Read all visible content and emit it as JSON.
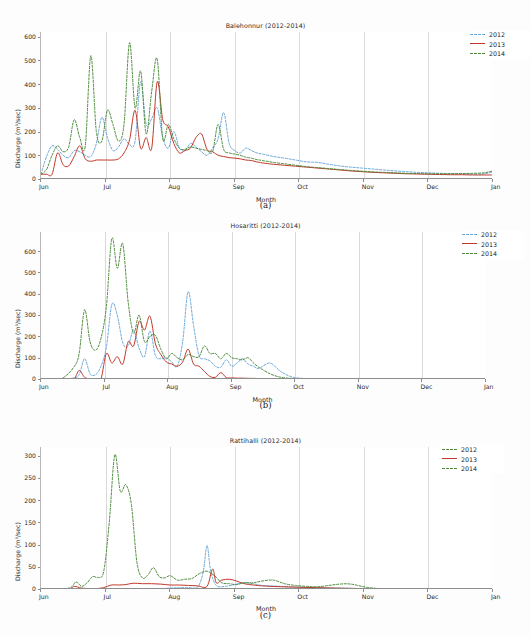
{
  "figure": {
    "page_width": 531,
    "page_height": 635,
    "top_strip_text": ""
  },
  "legend_labels": [
    "2012",
    "2013",
    "2014"
  ],
  "colors": {
    "series_2012": "#6aa8d8",
    "series_2013": "#c0392b",
    "series_2014": "#4d8b3b",
    "grid": "#d9d9d9",
    "axis": "#8d8d8d",
    "text": "#2a2a2a"
  },
  "captions": {
    "a": "(a)",
    "b": "(b)",
    "c": "(c)"
  },
  "chart_data": [
    {
      "id": "a",
      "type": "line",
      "title": "Balehonnur (2012-2014)",
      "xlabel": "Month",
      "ylabel": "Discharge (m³/sec)",
      "xticks": [
        "Jun",
        "Jul",
        "Aug",
        "Sep",
        "Oct",
        "Nov",
        "Dec",
        "Jan"
      ],
      "yticks": [
        0,
        100,
        200,
        300,
        400,
        500,
        600
      ],
      "ylim": [
        0,
        620
      ],
      "xlim": [
        0,
        245
      ],
      "grid": "vertical-at-month-starts",
      "legend_position": "upper-right-outside",
      "legend": [
        "2012",
        "2013",
        "2014"
      ],
      "series": [
        {
          "name": "2012",
          "style": "dashed",
          "color": "#6aa8d8",
          "x": [
            0,
            3,
            6,
            9,
            12,
            15,
            18,
            21,
            24,
            27,
            30,
            33,
            36,
            39,
            42,
            45,
            48,
            51,
            54,
            57,
            60,
            63,
            66,
            69,
            72,
            75,
            78,
            81,
            84,
            87,
            90,
            93,
            96,
            99,
            102,
            105,
            108,
            111,
            114,
            117,
            120,
            126,
            132,
            138,
            144,
            150,
            156,
            162,
            168,
            174,
            180,
            186,
            192,
            198,
            204,
            210,
            216,
            222,
            228,
            234,
            240,
            245
          ],
          "values": [
            20,
            95,
            140,
            125,
            100,
            90,
            120,
            115,
            100,
            95,
            150,
            260,
            175,
            120,
            135,
            170,
            145,
            160,
            410,
            230,
            255,
            300,
            175,
            130,
            200,
            130,
            120,
            150,
            135,
            115,
            100,
            130,
            170,
            280,
            150,
            120,
            110,
            130,
            120,
            110,
            105,
            95,
            88,
            80,
            72,
            70,
            62,
            55,
            50,
            46,
            42,
            38,
            34,
            31,
            28,
            26,
            24,
            23,
            22,
            21,
            22,
            30
          ]
        },
        {
          "name": "2013",
          "style": "solid",
          "color": "#c0392b",
          "x": [
            0,
            3,
            6,
            9,
            12,
            15,
            18,
            21,
            24,
            27,
            30,
            33,
            36,
            39,
            42,
            45,
            48,
            51,
            54,
            57,
            60,
            63,
            66,
            69,
            72,
            75,
            78,
            81,
            84,
            87,
            90,
            93,
            96,
            99,
            102,
            105,
            108,
            111,
            114,
            117,
            120,
            126,
            132,
            138,
            144,
            150,
            156,
            162,
            168,
            174,
            180,
            186,
            192,
            198,
            204,
            210,
            216,
            222,
            228,
            234,
            240,
            245
          ],
          "values": [
            20,
            20,
            20,
            110,
            60,
            55,
            95,
            140,
            85,
            75,
            80,
            80,
            80,
            80,
            85,
            110,
            165,
            290,
            130,
            175,
            130,
            410,
            250,
            220,
            150,
            110,
            120,
            130,
            175,
            190,
            125,
            115,
            100,
            95,
            90,
            88,
            85,
            80,
            78,
            72,
            68,
            62,
            58,
            54,
            50,
            46,
            42,
            38,
            34,
            31,
            28,
            26,
            24,
            22,
            21,
            20,
            19,
            18,
            18,
            17,
            17,
            17
          ]
        },
        {
          "name": "2014",
          "style": "dashed",
          "color": "#4d8b3b",
          "x": [
            0,
            3,
            6,
            9,
            12,
            15,
            18,
            21,
            24,
            27,
            30,
            33,
            36,
            39,
            42,
            45,
            48,
            51,
            54,
            57,
            60,
            63,
            66,
            69,
            72,
            75,
            78,
            81,
            84,
            87,
            90,
            93,
            96,
            99,
            102,
            105,
            108,
            111,
            114,
            117,
            120,
            126,
            132,
            138,
            144,
            150,
            156,
            162,
            168,
            174,
            180,
            186,
            192,
            198,
            204,
            210,
            216,
            222,
            228,
            234,
            240,
            245
          ],
          "values": [
            20,
            40,
            100,
            140,
            115,
            135,
            250,
            175,
            140,
            520,
            200,
            160,
            290,
            230,
            160,
            230,
            575,
            300,
            455,
            190,
            370,
            505,
            170,
            230,
            170,
            130,
            125,
            135,
            130,
            125,
            120,
            115,
            230,
            125,
            110,
            105,
            100,
            92,
            88,
            82,
            78,
            70,
            64,
            58,
            52,
            48,
            44,
            40,
            36,
            33,
            30,
            28,
            26,
            24,
            23,
            22,
            22,
            22,
            23,
            24,
            26,
            34
          ]
        }
      ]
    },
    {
      "id": "b",
      "type": "line",
      "title": "Hosaritti (2012-2014)",
      "xlabel": "Month",
      "ylabel": "Discharge (m³/sec)",
      "xticks": [
        "Jun",
        "Jul",
        "Aug",
        "Sep",
        "Oct",
        "Nov",
        "Dec",
        "Jan"
      ],
      "yticks": [
        0,
        100,
        200,
        300,
        400,
        500,
        600
      ],
      "ylim": [
        0,
        690
      ],
      "xlim": [
        0,
        245
      ],
      "grid": "vertical-at-month-starts",
      "legend_position": "upper-right-outside",
      "legend": [
        "2012",
        "2013",
        "2014"
      ],
      "series": [
        {
          "name": "2012",
          "style": "dashed",
          "color": "#6aa8d8",
          "x": [
            0,
            6,
            12,
            18,
            21,
            24,
            27,
            30,
            33,
            36,
            39,
            42,
            45,
            48,
            51,
            54,
            57,
            60,
            63,
            66,
            69,
            72,
            75,
            78,
            81,
            84,
            87,
            90,
            93,
            96,
            99,
            102,
            105,
            108,
            111,
            114,
            117,
            120,
            126,
            132,
            138,
            144,
            150,
            156,
            162,
            168,
            180,
            200,
            220,
            245
          ],
          "values": [
            0,
            0,
            0,
            5,
            20,
            95,
            25,
            20,
            60,
            150,
            350,
            300,
            170,
            155,
            230,
            145,
            105,
            225,
            110,
            95,
            100,
            80,
            60,
            175,
            410,
            250,
            110,
            95,
            85,
            60,
            55,
            90,
            60,
            75,
            95,
            70,
            60,
            50,
            75,
            35,
            10,
            3,
            1,
            0,
            0,
            0,
            0,
            0,
            0,
            0
          ]
        },
        {
          "name": "2013",
          "style": "solid",
          "color": "#c0392b",
          "x": [
            0,
            6,
            12,
            18,
            21,
            24,
            27,
            30,
            33,
            36,
            39,
            42,
            45,
            48,
            51,
            54,
            57,
            60,
            63,
            66,
            69,
            72,
            75,
            78,
            81,
            84,
            87,
            90,
            93,
            96,
            99,
            102,
            105,
            108,
            111,
            114,
            117,
            120,
            126,
            132,
            138,
            144,
            150,
            156,
            162,
            168,
            180,
            200,
            220,
            245
          ],
          "values": [
            0,
            0,
            0,
            0,
            40,
            8,
            0,
            0,
            0,
            120,
            75,
            105,
            70,
            175,
            155,
            270,
            230,
            295,
            165,
            115,
            80,
            70,
            60,
            80,
            140,
            70,
            60,
            35,
            12,
            8,
            30,
            7,
            5,
            4,
            4,
            3,
            3,
            2,
            2,
            1,
            1,
            0,
            0,
            0,
            0,
            0,
            0,
            0,
            0,
            0
          ]
        },
        {
          "name": "2014",
          "style": "dashed",
          "color": "#4d8b3b",
          "x": [
            0,
            6,
            12,
            18,
            21,
            24,
            27,
            30,
            33,
            36,
            39,
            42,
            45,
            48,
            51,
            54,
            57,
            60,
            63,
            66,
            69,
            72,
            75,
            78,
            81,
            84,
            87,
            90,
            93,
            96,
            99,
            102,
            105,
            108,
            111,
            114,
            117,
            120,
            126,
            132,
            138,
            144,
            150,
            156,
            162,
            168,
            180,
            200,
            220,
            245
          ],
          "values": [
            0,
            0,
            5,
            55,
            120,
            325,
            175,
            135,
            190,
            340,
            660,
            520,
            635,
            360,
            215,
            300,
            175,
            200,
            205,
            140,
            95,
            120,
            100,
            90,
            115,
            105,
            105,
            155,
            120,
            120,
            95,
            120,
            100,
            95,
            90,
            100,
            75,
            55,
            25,
            8,
            3,
            1,
            0,
            0,
            0,
            0,
            0,
            0,
            0,
            0
          ]
        }
      ]
    },
    {
      "id": "c",
      "type": "line",
      "title": "Rattihalli (2012-2014)",
      "xlabel": "Month",
      "ylabel": "Discharge (m³/sec)",
      "xticks": [
        "Jun",
        "Jul",
        "Aug",
        "Sep",
        "Oct",
        "Nov",
        "Dec",
        "Jan"
      ],
      "yticks": [
        0,
        50,
        100,
        150,
        200,
        250,
        300
      ],
      "ylim": [
        0,
        320
      ],
      "xlim": [
        0,
        245
      ],
      "grid": "vertical-at-month-starts",
      "legend_position": "upper-right-outside",
      "legend": [
        "2012",
        "2013",
        "2014"
      ],
      "series": [
        {
          "name": "2012",
          "style": "dashed",
          "color": "#6aa8d8",
          "x": [
            0,
            20,
            40,
            60,
            70,
            75,
            80,
            85,
            88,
            90,
            92,
            95,
            100,
            105,
            110,
            115,
            120,
            130,
            140,
            150,
            160,
            175,
            200,
            220,
            245
          ],
          "values": [
            0,
            0,
            0,
            0,
            2,
            3,
            3,
            5,
            40,
            98,
            40,
            8,
            6,
            10,
            14,
            12,
            8,
            6,
            4,
            3,
            2,
            1,
            0,
            0,
            0
          ]
        },
        {
          "name": "2013",
          "style": "solid",
          "color": "#c0392b",
          "x": [
            0,
            15,
            18,
            22,
            26,
            30,
            34,
            38,
            42,
            46,
            50,
            55,
            60,
            65,
            70,
            75,
            80,
            85,
            90,
            93,
            95,
            98,
            102,
            106,
            110,
            115,
            120,
            130,
            140,
            150,
            160,
            175,
            200,
            220,
            245
          ],
          "values": [
            1,
            1,
            6,
            2,
            1,
            1,
            3,
            9,
            9,
            10,
            13,
            12,
            12,
            11,
            9,
            9,
            8,
            7,
            6,
            45,
            14,
            20,
            22,
            18,
            12,
            9,
            7,
            5,
            4,
            3,
            2,
            1,
            0,
            0,
            0
          ]
        },
        {
          "name": "2014",
          "style": "dashed",
          "color": "#4d8b3b",
          "x": [
            0,
            10,
            16,
            19,
            22,
            25,
            28,
            31,
            34,
            37,
            40,
            43,
            46,
            49,
            52,
            55,
            58,
            61,
            64,
            67,
            70,
            74,
            78,
            82,
            86,
            90,
            94,
            98,
            102,
            106,
            110,
            115,
            120,
            126,
            132,
            138,
            144,
            150,
            156,
            162,
            168,
            180,
            200,
            220,
            245
          ],
          "values": [
            1,
            1,
            3,
            16,
            6,
            14,
            28,
            26,
            40,
            150,
            302,
            220,
            235,
            190,
            60,
            25,
            32,
            48,
            28,
            25,
            30,
            20,
            22,
            24,
            35,
            40,
            30,
            14,
            12,
            10,
            14,
            14,
            18,
            20,
            12,
            8,
            6,
            5,
            8,
            11,
            11,
            2,
            0,
            0,
            0
          ]
        }
      ]
    }
  ]
}
